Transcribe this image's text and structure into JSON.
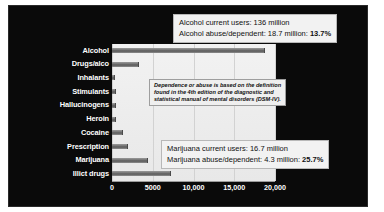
{
  "chart_data": {
    "type": "bar",
    "orientation": "horizontal",
    "title": "",
    "xlabel": "",
    "ylabel": "",
    "xlim": [
      0,
      20000
    ],
    "grid": true,
    "legend": "none",
    "xticks": [
      "0",
      "5000",
      "10,000",
      "15,000",
      "20,000"
    ],
    "xtick_values": [
      0,
      5000,
      10000,
      15000,
      20000
    ],
    "categories": [
      "Alcohol",
      "Drugs/alco",
      "Inhalants",
      "Stimulants",
      "Hallucinogens",
      "Heroin",
      "Cocaine",
      "Prescription",
      "Marijuana",
      "Illict drugs"
    ],
    "values": [
      18700,
      3200,
      200,
      350,
      350,
      330,
      1200,
      1900,
      4300,
      7100
    ],
    "annotations": [
      "Alcohol current users: 136 million",
      "Alcohol abuse/dependent: 18.7 million: 13.7%",
      "Marijuana current users: 16.7 million",
      "Marijuana abuse/dependent: 4.3 million: 25.7%",
      "Dependence or abuse is based on the definition found in the 4th edition of the diagnostic and statistical manual of mental disorders (DSM-IV)."
    ]
  },
  "callouts": {
    "alcohol": {
      "line1": "Alcohol current users: 136 million",
      "line2_prefix": "Alcohol abuse/dependent: 18.7 million: ",
      "line2_pct": "13.7%"
    },
    "marijuana": {
      "line1": "Marijuana current users: 16.7 million",
      "line2_prefix": "Marijuana abuse/dependent: 4.3 million: ",
      "line2_pct": "25.7%"
    }
  },
  "note": {
    "line1": "Dependence or abuse is based on the definition",
    "line2": "found in the 4th edition of the diagnostic and",
    "line3": "statistical manual of mental disorders (DSM-IV)."
  },
  "colors": {
    "slide_background": "#0a0a0a",
    "plot_background": "#ececec",
    "bar_fill": "#6e6e6e",
    "label_text": "#ffffff",
    "callout_background": "#f2f2f2",
    "callout_border": "#b8b8b8"
  }
}
